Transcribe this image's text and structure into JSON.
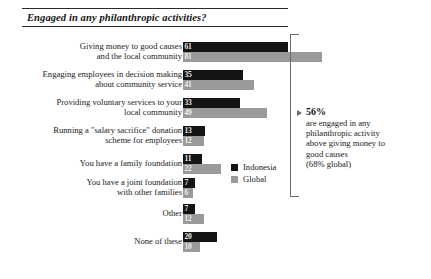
{
  "title": "Engaged in any philanthropic activities?",
  "legend": {
    "items": [
      {
        "label": "Indonesia",
        "color": "#141414"
      },
      {
        "label": "Global",
        "color": "#9a9a9a"
      }
    ]
  },
  "annotation": {
    "value": "56%",
    "line1": "are engaged in any",
    "line2": "philanthropic activity",
    "line3": "above giving money to",
    "line4": "good causes",
    "line5": "(68% global)"
  },
  "chart_data": {
    "type": "bar",
    "orientation": "horizontal",
    "title": "Engaged in any philanthropic activities?",
    "xlabel": "",
    "ylabel": "",
    "xlim": [
      0,
      100
    ],
    "grid": false,
    "legend_position": "center-right",
    "value_labels": true,
    "categories": [
      "Giving money to good causes and the local community",
      "Engaging employees in decision making about community service",
      "Providing voluntary services to your local community",
      "Running a \"salary sacrifice\" donation scheme for employees",
      "You have a family foundation",
      "You have a joint foundation with other families",
      "Other",
      "None of these"
    ],
    "categories_wrapped": [
      [
        "Giving money to good causes",
        "and the local community"
      ],
      [
        "Engaging employees in decision making",
        "about community service"
      ],
      [
        "Providing voluntary services to your",
        "local community"
      ],
      [
        "Running a \"salary sacrifice\" donation",
        "scheme for employees"
      ],
      [
        "You have a family foundation"
      ],
      [
        "You have a joint foundation",
        "with other families"
      ],
      [
        "Other"
      ],
      [
        "None of these"
      ]
    ],
    "series": [
      {
        "name": "Indonesia",
        "color": "#141414",
        "values": [
          61,
          35,
          33,
          13,
          11,
          7,
          7,
          20
        ]
      },
      {
        "name": "Global",
        "color": "#9a9a9a",
        "values": [
          81,
          41,
          49,
          12,
          22,
          6,
          12,
          10
        ]
      }
    ],
    "annotations": [
      {
        "text": "56% are engaged in any philanthropic activity above giving money to good causes (68% global)",
        "covers_categories": [
          1,
          2,
          3,
          4,
          5,
          6,
          7
        ],
        "type": "bracket"
      }
    ]
  }
}
